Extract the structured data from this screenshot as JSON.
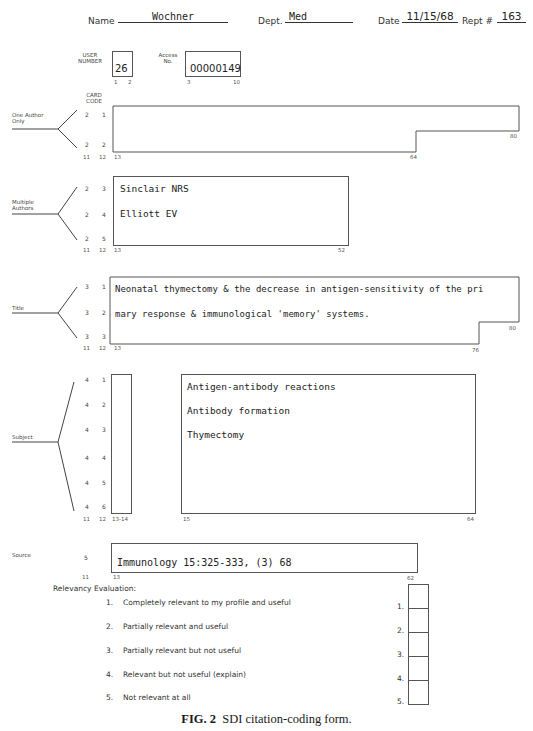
{
  "header": {
    "name_label": "Name",
    "name_value": "Wochner",
    "dept_label": "Dept.",
    "dept_value": "Med",
    "date_label": "Date",
    "date_value": "11/15/68",
    "rept_label": "Rept #",
    "rept_value": "163"
  },
  "user_number": {
    "label_line1": "USER",
    "label_line2": "NUMBER",
    "value": "26",
    "col_start": "1",
    "col_end": "2"
  },
  "access_no": {
    "label_line1": "Access",
    "label_line2": "No.",
    "value": "00000149",
    "col_start": "3",
    "col_end": "10"
  },
  "card_code": {
    "label_line1": "CARD",
    "label_line2": "CODE"
  },
  "sections": {
    "one_author": {
      "label_line1": "One Author",
      "label_line2": "Only",
      "codes": [
        [
          "2",
          "1"
        ],
        [
          "2",
          "2"
        ]
      ],
      "cols": [
        "11",
        "12",
        "13"
      ],
      "col_mid": "64",
      "col_end": "80",
      "lines": []
    },
    "multiple_authors": {
      "label_line1": "Multiple",
      "label_line2": "Authors",
      "codes": [
        [
          "2",
          "3"
        ],
        [
          "2",
          "4"
        ],
        [
          "2",
          "5"
        ]
      ],
      "cols": [
        "11",
        "12",
        "13"
      ],
      "col_end": "52",
      "lines": [
        "Sinclair NRS",
        "Elliott EV"
      ]
    },
    "title": {
      "label": "Title",
      "codes": [
        [
          "3",
          "1"
        ],
        [
          "3",
          "2"
        ],
        [
          "3",
          "3"
        ]
      ],
      "cols": [
        "11",
        "12",
        "13"
      ],
      "col_mid": "76",
      "col_end": "80",
      "lines": [
        "Neonatal thymectomy & the decrease in antigen-sensitivity of the pri",
        "mary response & immunological 'memory' systems."
      ]
    },
    "subject": {
      "label": "Subject",
      "codes": [
        [
          "4",
          "1"
        ],
        [
          "4",
          "2"
        ],
        [
          "4",
          "3"
        ],
        [
          "4",
          "4"
        ],
        [
          "4",
          "5"
        ],
        [
          "4",
          "6"
        ]
      ],
      "cols": [
        "11",
        "12",
        "13-14"
      ],
      "col_start": "15",
      "col_end": "64",
      "lines": [
        "Antigen-antibody reactions",
        "Antibody formation",
        "Thymectomy"
      ]
    },
    "source": {
      "label": "Source",
      "code": "5",
      "cols": [
        "11",
        "13"
      ],
      "col_end": "62",
      "value": "Immunology 15:325-333, (3) 68"
    }
  },
  "relevancy": {
    "title": "Relevancy Evaluation:",
    "items": [
      {
        "num": "1.",
        "text": "Completely relevant to my profile and useful",
        "box_label": "1."
      },
      {
        "num": "2.",
        "text": "Partially relevant and useful",
        "box_label": "2."
      },
      {
        "num": "3.",
        "text": "Partially relevant but not useful",
        "box_label": "3."
      },
      {
        "num": "4.",
        "text": "Relevant but not useful (explain)",
        "box_label": "4."
      },
      {
        "num": "5.",
        "text": "Not relevant at all",
        "box_label": "5."
      }
    ]
  },
  "caption": {
    "fig": "FIG. 2",
    "text": "SDI citation-coding form."
  }
}
